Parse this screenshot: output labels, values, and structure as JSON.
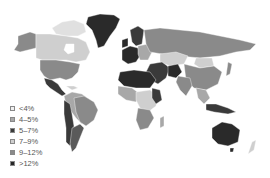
{
  "map": {
    "type": "choropleth world map",
    "legend": [
      {
        "label": "<4%",
        "color": "#f0f0f0"
      },
      {
        "label": "4–5%",
        "color": "#a8a8a8"
      },
      {
        "label": "5–7%",
        "color": "#3a3a3a"
      },
      {
        "label": "7–9%",
        "color": "#cfcfcf"
      },
      {
        "label": "9–12%",
        "color": "#8a8a8a"
      },
      {
        "label": ">12%",
        "color": "#262626"
      }
    ]
  }
}
